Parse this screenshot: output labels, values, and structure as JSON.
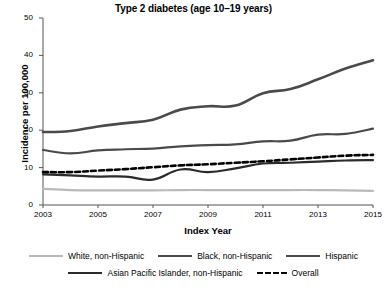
{
  "chart_data": {
    "type": "line",
    "title": "Type 2 diabetes (age 10–19 years)",
    "xlabel": "Index Year",
    "ylabel": "Incidence per 100,000",
    "xlim": [
      2003,
      2015
    ],
    "ylim": [
      0,
      50
    ],
    "grid": false,
    "legend_position": "bottom",
    "x": [
      2003,
      2004,
      2005,
      2006,
      2007,
      2008,
      2009,
      2010,
      2011,
      2012,
      2013,
      2014,
      2015
    ],
    "xticks": [
      "2003",
      "2005",
      "2007",
      "2009",
      "2011",
      "2013",
      "2015"
    ],
    "xtick_values": [
      2003,
      2005,
      2007,
      2009,
      2011,
      2013,
      2015
    ],
    "yticks": [
      "0",
      "10",
      "20",
      "30",
      "40",
      "50"
    ],
    "ytick_values": [
      0,
      10,
      20,
      30,
      40,
      50
    ],
    "series": [
      {
        "name": "White, non-Hispanic",
        "color": "#b9b9b9",
        "style": "solid",
        "width": 2.2,
        "values": [
          4.3,
          4.0,
          3.9,
          3.9,
          3.9,
          4.0,
          4.0,
          4.0,
          4.0,
          4.0,
          4.0,
          3.9,
          3.8
        ]
      },
      {
        "name": "Black, non-Hispanic",
        "color": "#4a4a4a",
        "style": "solid",
        "width": 2.2,
        "values": [
          14.7,
          13.8,
          14.6,
          14.9,
          15.1,
          15.7,
          16.0,
          16.2,
          17.0,
          17.2,
          18.8,
          19.0,
          20.4
        ]
      },
      {
        "name": "Hispanic",
        "color": "#4a4a4a",
        "style": "solid",
        "width": 2.6,
        "values": [
          19.5,
          19.8,
          21.0,
          21.9,
          22.8,
          25.5,
          26.4,
          26.6,
          29.9,
          31.0,
          33.6,
          36.5,
          38.7
        ]
      },
      {
        "name": "Asian Pacific Islander, non-Hispanic",
        "color": "#2b2b2b",
        "style": "solid",
        "width": 2.2,
        "values": [
          8.2,
          7.9,
          7.6,
          7.6,
          6.8,
          9.5,
          8.8,
          9.8,
          11.1,
          11.3,
          11.6,
          11.9,
          12.0
        ]
      },
      {
        "name": "Overall",
        "color": "#000000",
        "style": "dashed",
        "width": 2.6,
        "values": [
          8.8,
          8.8,
          9.2,
          9.6,
          10.1,
          10.6,
          10.9,
          11.3,
          11.7,
          12.2,
          12.7,
          13.2,
          13.4
        ]
      }
    ]
  }
}
